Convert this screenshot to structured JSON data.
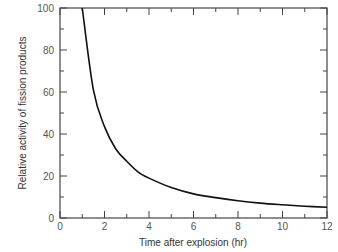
{
  "chart_data": {
    "type": "line",
    "title": "",
    "xlabel": "Time after explosion (hr)",
    "ylabel": "Relative activity of fission products",
    "xlim": [
      0,
      12
    ],
    "ylim": [
      0,
      100
    ],
    "xticks": [
      0,
      2,
      4,
      6,
      8,
      10,
      12
    ],
    "yticks": [
      0,
      20,
      40,
      60,
      80,
      100
    ],
    "grid": false,
    "legend": null,
    "series": [
      {
        "name": "Relative activity",
        "x": [
          1,
          1.5,
          2,
          2.5,
          3,
          3.5,
          4,
          5,
          6,
          7,
          8,
          9,
          10,
          11,
          12
        ],
        "y": [
          100,
          61,
          43.5,
          33,
          27,
          22,
          19,
          14.5,
          11.5,
          9.7,
          8.2,
          7.1,
          6.3,
          5.6,
          5.1
        ]
      }
    ]
  }
}
